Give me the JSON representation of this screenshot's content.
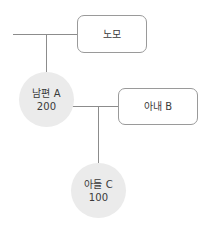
{
  "diagram": {
    "background_color": "#ffffff",
    "line_color": "#8c8c8c",
    "box_border_color": "#9a9a9a",
    "circle_fill_color": "#ebebeb",
    "text_color": "#3a3a3a",
    "nodes": [
      {
        "id": "nomo",
        "shape": "rounded-rectangle",
        "label": "노모",
        "value": ""
      },
      {
        "id": "husband",
        "shape": "circle",
        "label": "남편 A",
        "value": "200"
      },
      {
        "id": "wife",
        "shape": "rounded-rectangle",
        "label": "아내 B",
        "value": ""
      },
      {
        "id": "son",
        "shape": "circle",
        "label": "아들 C",
        "value": "100"
      }
    ],
    "edges": [
      {
        "id": "edge-left-stub-to-nomo",
        "from": "left-margin",
        "to": "nomo"
      },
      {
        "id": "edge-nomo-to-husband",
        "from": "nomo",
        "to": "husband"
      },
      {
        "id": "edge-husband-to-wife",
        "from": "husband",
        "to": "wife"
      },
      {
        "id": "edge-couple-to-son",
        "from": "husband-wife-union",
        "to": "son"
      }
    ]
  }
}
